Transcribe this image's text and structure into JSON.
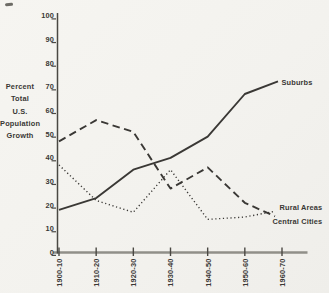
{
  "page": {
    "background": "#f4f3ef",
    "ink": "#3a3835",
    "axis_color": "#4a4843",
    "baseline_color": "#908f89"
  },
  "y_axis": {
    "title_lines": [
      "Percent",
      "Total",
      "U.S.",
      "Population",
      "Growth"
    ],
    "tick_labels": [
      "100",
      "90",
      "80",
      "70",
      "60",
      "50",
      "40",
      "30",
      "20",
      "10",
      "0"
    ],
    "min": 0,
    "max": 100
  },
  "x_axis": {
    "tick_labels": [
      "1900-10",
      "1910-20",
      "1920-30",
      "1930-40",
      "1940-50",
      "1950-60",
      "1960-70"
    ]
  },
  "chart_data": {
    "type": "line",
    "title": "",
    "categories": [
      "1900-10",
      "1910-20",
      "1920-30",
      "1930-40",
      "1940-50",
      "1950-60",
      "1960-70"
    ],
    "xlabel": "",
    "ylabel": "Percent Total U.S. Population Growth",
    "ylim": [
      0,
      100
    ],
    "y_tick_step": 10,
    "grid": false,
    "legend_position": "line-end-labels",
    "series": [
      {
        "name": "Suburbs",
        "line_style": "solid",
        "values": [
          18,
          23,
          35,
          40,
          49,
          67,
          73
        ]
      },
      {
        "name": "Central Cities",
        "line_style": "dashed",
        "values": [
          47,
          56,
          51,
          27,
          36,
          21,
          14
        ]
      },
      {
        "name": "Rural Areas",
        "line_style": "dotted",
        "values": [
          37,
          22,
          17,
          35,
          14,
          15,
          18
        ]
      }
    ]
  }
}
